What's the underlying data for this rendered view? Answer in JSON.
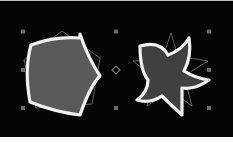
{
  "canvas": {
    "background": "#050505",
    "selection": {
      "handle_color": "#6a6a6a",
      "center_marker": "diamond",
      "bounds": {
        "left": 23,
        "top": 31,
        "right": 209,
        "bottom": 108
      },
      "center": {
        "x": 116,
        "y": 70
      }
    },
    "shapes": [
      {
        "name": "distorted-pentagon",
        "fill": "#5a5a5a",
        "stroke": "#f2f2f2",
        "guide_shape": "pentagon",
        "guide_color": "#777777"
      },
      {
        "name": "twisted-star",
        "fill": "#404040",
        "stroke": "#f2f2f2",
        "guide_shape": "star",
        "guide_color": "#777777"
      }
    ]
  }
}
